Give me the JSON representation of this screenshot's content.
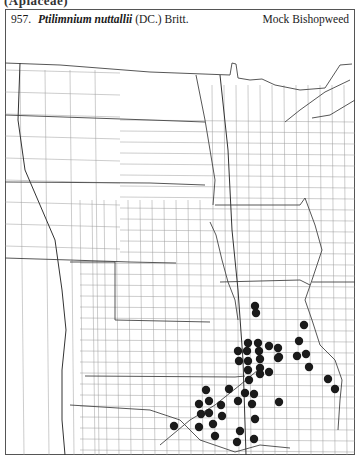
{
  "page": {
    "family_header": "(Apiaceae)",
    "entry_number": "957.",
    "scientific_name": "Ptilimnium nuttallii",
    "authority": "(DC.) Britt.",
    "common_name": "Mock Bishopweed"
  },
  "map": {
    "region": "Great Plains, USA (county outline map)",
    "dot_color": "#1a1a1a",
    "line_color": "#555555",
    "dot_radius": 4.2,
    "occurrences": [
      [
        255,
        306
      ],
      [
        256,
        313
      ],
      [
        304,
        325
      ],
      [
        299,
        341
      ],
      [
        248,
        343
      ],
      [
        258,
        343
      ],
      [
        269,
        346
      ],
      [
        278,
        348
      ],
      [
        238,
        351
      ],
      [
        247,
        351
      ],
      [
        259,
        351
      ],
      [
        297,
        356
      ],
      [
        306,
        354
      ],
      [
        279,
        357
      ],
      [
        239,
        361
      ],
      [
        248,
        361
      ],
      [
        260,
        359
      ],
      [
        278,
        358
      ],
      [
        248,
        370
      ],
      [
        260,
        368
      ],
      [
        269,
        372
      ],
      [
        260,
        374
      ],
      [
        309,
        367
      ],
      [
        249,
        380
      ],
      [
        328,
        379
      ],
      [
        335,
        389
      ],
      [
        206,
        390
      ],
      [
        229,
        389
      ],
      [
        245,
        393
      ],
      [
        254,
        394
      ],
      [
        209,
        401
      ],
      [
        238,
        401
      ],
      [
        199,
        404
      ],
      [
        221,
        405
      ],
      [
        252,
        404
      ],
      [
        279,
        402
      ],
      [
        201,
        414
      ],
      [
        209,
        413
      ],
      [
        222,
        416
      ],
      [
        255,
        419
      ],
      [
        174,
        426
      ],
      [
        199,
        427
      ],
      [
        213,
        424
      ],
      [
        240,
        431
      ],
      [
        215,
        436
      ],
      [
        237,
        442
      ],
      [
        254,
        439
      ]
    ]
  }
}
